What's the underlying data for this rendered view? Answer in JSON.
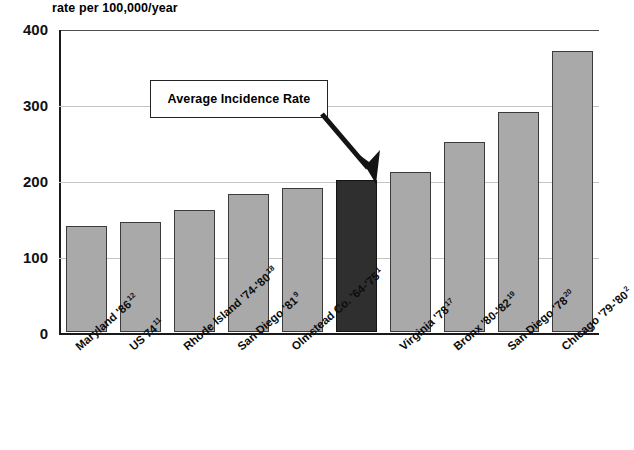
{
  "chart_data": {
    "type": "bar",
    "title": "",
    "ylabel": "rate per 100,000/year",
    "xlabel": "",
    "ylim": [
      0,
      400
    ],
    "yticks": [
      0,
      100,
      200,
      300,
      400
    ],
    "grid": true,
    "legend": "none",
    "categories": [
      "Maryland '86",
      "US 74",
      "Rhode Island '74-'80",
      "San Diego '81",
      "Olmstead Co. '64-'75",
      "",
      "Virginia '78",
      "Bronx '80-'82",
      "San Diego '78",
      "Chicago '79-'80"
    ],
    "category_refs": [
      "12",
      "11",
      "18",
      "9",
      "1",
      "",
      "17",
      "19",
      "20",
      "2"
    ],
    "values": [
      140,
      145,
      160,
      182,
      190,
      200,
      210,
      250,
      290,
      370
    ],
    "highlight_index": 5,
    "annotations": [
      {
        "text": "Average Incidence Rate",
        "points_to_index": 5,
        "value": 200
      }
    ],
    "colors": {
      "bar": "#a9a9a9",
      "bar_border": "#3b3b3b",
      "highlight_bar": "#2f2f2f",
      "gridline": "#c4c4c4",
      "axis": "#1a1a1a",
      "text": "#000000"
    }
  }
}
